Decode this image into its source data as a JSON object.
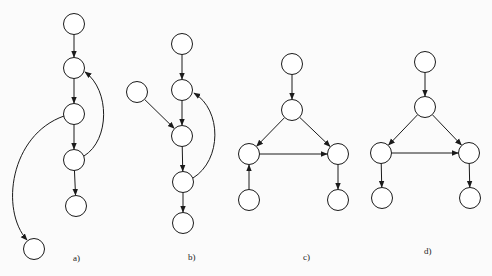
{
  "graphs": [
    {
      "label": "a)",
      "label_pos": [
        73,
        259
      ],
      "nodes": [
        [
          74,
          24
        ],
        [
          74,
          68
        ],
        [
          74,
          114
        ],
        [
          74,
          160
        ],
        [
          76,
          206
        ],
        [
          34,
          249
        ]
      ],
      "edges": [
        {
          "from": 0,
          "to": 1,
          "type": "straight"
        },
        {
          "from": 1,
          "to": 2,
          "type": "straight"
        },
        {
          "from": 2,
          "to": 3,
          "type": "straight"
        },
        {
          "from": 3,
          "to": 4,
          "type": "straight"
        },
        {
          "from": 3,
          "to": 1,
          "type": "curve",
          "path": "M84,156 C110,140 110,90 85,72"
        },
        {
          "from": 2,
          "to": 5,
          "type": "curve",
          "path": "M64,116 C10,135 0,210 27,240"
        }
      ]
    },
    {
      "label": "b)",
      "label_pos": [
        188,
        258
      ],
      "nodes": [
        [
          182,
          44
        ],
        [
          137,
          92
        ],
        [
          182,
          90
        ],
        [
          182,
          136
        ],
        [
          183,
          182
        ],
        [
          183,
          223
        ]
      ],
      "edges": [
        {
          "from": 0,
          "to": 2,
          "type": "straight"
        },
        {
          "from": 2,
          "to": 3,
          "type": "straight"
        },
        {
          "from": 1,
          "to": 3,
          "type": "straight"
        },
        {
          "from": 3,
          "to": 4,
          "type": "straight"
        },
        {
          "from": 4,
          "to": 5,
          "type": "straight"
        },
        {
          "from": 4,
          "to": 2,
          "type": "curve",
          "path": "M193,178 C222,160 222,110 194,93"
        }
      ]
    },
    {
      "label": "c)",
      "label_pos": [
        303,
        258
      ],
      "nodes": [
        [
          292,
          64
        ],
        [
          292,
          110
        ],
        [
          249,
          154
        ],
        [
          338,
          154
        ],
        [
          249,
          200
        ],
        [
          338,
          200
        ]
      ],
      "edges": [
        {
          "from": 0,
          "to": 1,
          "type": "straight"
        },
        {
          "from": 1,
          "to": 2,
          "type": "straight"
        },
        {
          "from": 1,
          "to": 3,
          "type": "straight"
        },
        {
          "from": 2,
          "to": 3,
          "type": "straight"
        },
        {
          "from": 4,
          "to": 2,
          "type": "straight"
        },
        {
          "from": 3,
          "to": 5,
          "type": "straight"
        }
      ]
    },
    {
      "label": "d)",
      "label_pos": [
        424,
        252
      ],
      "nodes": [
        [
          425,
          62
        ],
        [
          425,
          107
        ],
        [
          381,
          153
        ],
        [
          469,
          153
        ],
        [
          382,
          198
        ],
        [
          470,
          198
        ]
      ],
      "edges": [
        {
          "from": 0,
          "to": 1,
          "type": "straight"
        },
        {
          "from": 1,
          "to": 2,
          "type": "straight"
        },
        {
          "from": 1,
          "to": 3,
          "type": "straight"
        },
        {
          "from": 2,
          "to": 3,
          "type": "straight"
        },
        {
          "from": 2,
          "to": 4,
          "type": "straight"
        },
        {
          "from": 3,
          "to": 5,
          "type": "straight"
        }
      ]
    }
  ],
  "style": {
    "node_radius": 10.5,
    "stroke": "#1a1a1a",
    "fill": "#ffffff"
  }
}
